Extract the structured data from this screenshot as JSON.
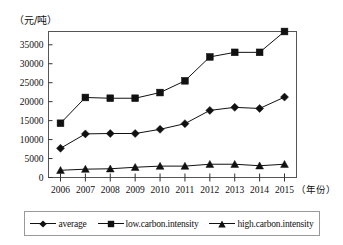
{
  "chart_data": {
    "type": "line",
    "title": "",
    "subtitle": "",
    "xlabel": "（年份）",
    "ylabel": "（元/吨）",
    "categories": [
      "2006",
      "2007",
      "2008",
      "2009",
      "2010",
      "2011",
      "2012",
      "2013",
      "2014",
      "2015"
    ],
    "x": [
      2006,
      2007,
      2008,
      2009,
      2010,
      2011,
      2012,
      2013,
      2014,
      2015
    ],
    "ylim": [
      0,
      38500
    ],
    "yticks": [
      0,
      5000,
      10000,
      15000,
      20000,
      25000,
      30000,
      35000
    ],
    "ytick_labels": [
      "0",
      "5000",
      "10000",
      "15000",
      "20000",
      "25000",
      "30000",
      "35000"
    ],
    "grid": false,
    "legend_position": "bottom",
    "series": [
      {
        "name": "average",
        "marker": "diamond",
        "color": "#111111",
        "values": [
          7700,
          11500,
          11600,
          11600,
          12700,
          14200,
          17700,
          18500,
          18200,
          21200
        ]
      },
      {
        "name": "low.carbon.intensity",
        "marker": "square",
        "color": "#111111",
        "values": [
          14300,
          21100,
          20900,
          20900,
          22400,
          25500,
          31800,
          33000,
          33000,
          38500
        ]
      },
      {
        "name": "high.carbon.intensity",
        "marker": "triangle",
        "color": "#111111",
        "values": [
          1900,
          2200,
          2300,
          2700,
          3000,
          3000,
          3500,
          3500,
          3100,
          3500
        ]
      }
    ]
  },
  "axes": {
    "y_unit_label": "（元/吨）",
    "x_unit_label": "（年份）"
  },
  "legend": {
    "items": [
      {
        "label": "average",
        "marker": "diamond-marker-icon"
      },
      {
        "label": "low.carbon.intensity",
        "marker": "square-marker-icon"
      },
      {
        "label": "high.carbon.intensity",
        "marker": "triangle-marker-icon"
      }
    ]
  }
}
